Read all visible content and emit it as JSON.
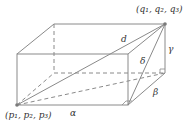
{
  "figure": {
    "type": "rectangular box with space diagonal",
    "colors": {
      "line": "#8a8a8a",
      "point": "#7a7a7a",
      "text": "#333333",
      "background": "#ffffff"
    },
    "labels": {
      "q_point": "(q₁, q₂, q₃)",
      "p_point": "(p₁, p₂, p₃)",
      "d": "d",
      "delta": "δ",
      "gamma": "γ",
      "beta": "β",
      "alpha": "α"
    },
    "edges_meaning": {
      "alpha": "length along front bottom edge",
      "beta": "depth along bottom right edge",
      "gamma": "height along back right edge",
      "delta": "diagonal of right face",
      "d": "space diagonal from p to q"
    }
  }
}
